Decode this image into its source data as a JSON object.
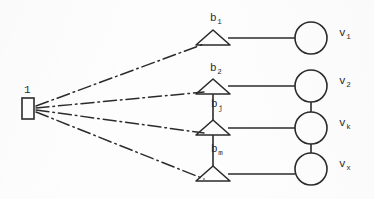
{
  "figure": {
    "background_color": "#fdfdfd",
    "ink_color": "#2b2b2b"
  },
  "root": {
    "label": "1",
    "label_sub": "",
    "shape": "rectangle",
    "x": 27,
    "y": 108
  },
  "branch_nodes": [
    {
      "id": "b1",
      "label": "b",
      "sub": "1",
      "shape": "triangle",
      "apex_x": 213,
      "apex_y": 30,
      "base_y": 45
    },
    {
      "id": "b2",
      "label": "b",
      "sub": "2",
      "shape": "triangle",
      "apex_x": 213,
      "apex_y": 79,
      "base_y": 94
    },
    {
      "id": "bj",
      "label": "b",
      "sub": "j",
      "shape": "triangle",
      "apex_x": 213,
      "apex_y": 120,
      "base_y": 135
    },
    {
      "id": "bm",
      "label": "b",
      "sub": "m",
      "shape": "triangle",
      "apex_x": 213,
      "apex_y": 166,
      "base_y": 181
    }
  ],
  "terminal_nodes": [
    {
      "id": "v1",
      "label": "v",
      "sub": "1",
      "shape": "circle",
      "cx": 311,
      "cy": 38,
      "r": 16
    },
    {
      "id": "v2",
      "label": "v",
      "sub": "2",
      "shape": "circle",
      "cx": 311,
      "cy": 86,
      "r": 16
    },
    {
      "id": "vk",
      "label": "v",
      "sub": "k",
      "shape": "circle",
      "cx": 311,
      "cy": 128,
      "r": 16
    },
    {
      "id": "vx",
      "label": "v",
      "sub": "x",
      "shape": "circle",
      "cx": 311,
      "cy": 169,
      "r": 16
    }
  ],
  "edges": {
    "root_to_branches_style": "dash-dot",
    "branch_to_terminal_style": "solid",
    "branch_chain_style": "solid",
    "terminal_chain_style": "solid"
  }
}
